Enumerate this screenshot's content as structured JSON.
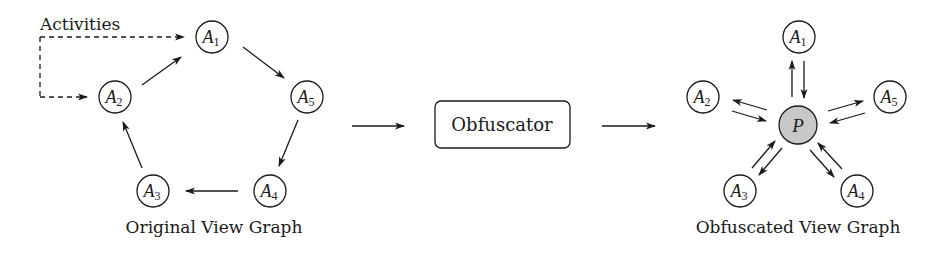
{
  "diagram": {
    "colors": {
      "stroke": "#1a1a1a",
      "node_fill": "#ffffff",
      "proxy_fill": "#c8c8c8",
      "background": "#ffffff"
    },
    "activities_label": "Activities",
    "original_graph": {
      "caption": "Original View Graph",
      "nodes": [
        {
          "id": "A1",
          "base": "A",
          "sub": "1",
          "cx": 212,
          "cy": 37
        },
        {
          "id": "A2",
          "base": "A",
          "sub": "2",
          "cx": 115,
          "cy": 97
        },
        {
          "id": "A3",
          "base": "A",
          "sub": "3",
          "cx": 153,
          "cy": 191
        },
        {
          "id": "A4",
          "base": "A",
          "sub": "4",
          "cx": 270,
          "cy": 191
        },
        {
          "id": "A5",
          "base": "A",
          "sub": "5",
          "cx": 307,
          "cy": 97
        }
      ],
      "edges": [
        {
          "from": "A2",
          "to": "A1"
        },
        {
          "from": "A1",
          "to": "A5"
        },
        {
          "from": "A5",
          "to": "A4"
        },
        {
          "from": "A4",
          "to": "A3"
        },
        {
          "from": "A3",
          "to": "A2"
        }
      ],
      "entry_points": [
        "A1",
        "A2"
      ]
    },
    "obfuscator": {
      "label": "Obfuscator"
    },
    "obfuscated_graph": {
      "caption": "Obfuscated View Graph",
      "proxy": {
        "id": "P",
        "label": "P",
        "cx": 798,
        "cy": 125
      },
      "nodes": [
        {
          "id": "A1",
          "base": "A",
          "sub": "1",
          "cx": 799,
          "cy": 37
        },
        {
          "id": "A2",
          "base": "A",
          "sub": "2",
          "cx": 703,
          "cy": 97
        },
        {
          "id": "A3",
          "base": "A",
          "sub": "3",
          "cx": 740,
          "cy": 191
        },
        {
          "id": "A4",
          "base": "A",
          "sub": "4",
          "cx": 857,
          "cy": 191
        },
        {
          "id": "A5",
          "base": "A",
          "sub": "5",
          "cx": 890,
          "cy": 97
        }
      ],
      "edges": [
        {
          "from": "P",
          "to": "A1"
        },
        {
          "from": "A1",
          "to": "P"
        },
        {
          "from": "P",
          "to": "A2"
        },
        {
          "from": "A2",
          "to": "P"
        },
        {
          "from": "P",
          "to": "A3"
        },
        {
          "from": "A3",
          "to": "P"
        },
        {
          "from": "P",
          "to": "A4"
        },
        {
          "from": "A4",
          "to": "P"
        },
        {
          "from": "P",
          "to": "A5"
        },
        {
          "from": "A5",
          "to": "P"
        }
      ]
    }
  }
}
